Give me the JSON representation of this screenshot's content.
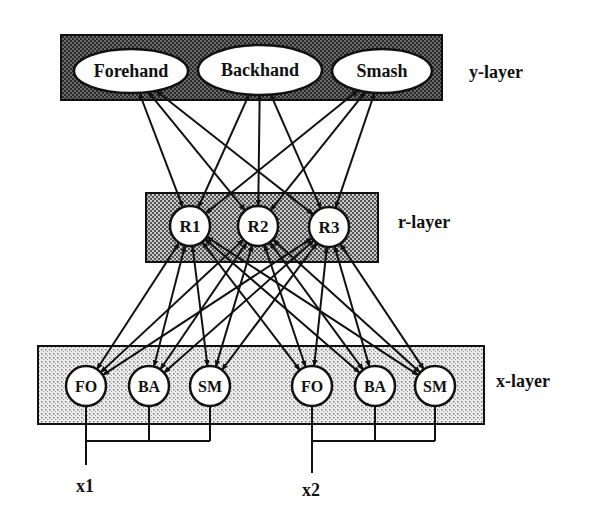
{
  "diagram": {
    "type": "layered-network",
    "layers": {
      "y": {
        "label": "y-layer",
        "nodes": [
          {
            "id": "forehand",
            "label": "Forehand",
            "cx": 131,
            "cy": 71,
            "rx": 57,
            "ry": 22
          },
          {
            "id": "backhand",
            "label": "Backhand",
            "cx": 260,
            "cy": 70,
            "rx": 62,
            "ry": 25
          },
          {
            "id": "smash",
            "label": "Smash",
            "cx": 382,
            "cy": 71,
            "rx": 50,
            "ry": 22
          }
        ]
      },
      "r": {
        "label": "r-layer",
        "nodes": [
          {
            "id": "r1",
            "label": "R1",
            "cx": 190,
            "cy": 226
          },
          {
            "id": "r2",
            "label": "R2",
            "cx": 258,
            "cy": 226
          },
          {
            "id": "r3",
            "label": "R3",
            "cx": 329,
            "cy": 227
          }
        ]
      },
      "x": {
        "label": "x-layer",
        "nodes": [
          {
            "id": "x1-fo",
            "label": "FO",
            "cx": 86,
            "cy": 386,
            "group": "x1"
          },
          {
            "id": "x1-ba",
            "label": "BA",
            "cx": 149,
            "cy": 386,
            "group": "x1"
          },
          {
            "id": "x1-sm",
            "label": "SM",
            "cx": 210,
            "cy": 386,
            "group": "x1"
          },
          {
            "id": "x2-fo",
            "label": "FO",
            "cx": 312,
            "cy": 386,
            "group": "x2"
          },
          {
            "id": "x2-ba",
            "label": "BA",
            "cx": 375,
            "cy": 386,
            "group": "x2"
          },
          {
            "id": "x2-sm",
            "label": "SM",
            "cx": 435,
            "cy": 386,
            "group": "x2"
          }
        ]
      }
    },
    "inputs": [
      {
        "id": "x1",
        "label": "x1"
      },
      {
        "id": "x2",
        "label": "x2"
      }
    ],
    "connections": "bidirectional arrows: every y-node to every r-node, every r-node to every x-node",
    "colors": {
      "ink": "#111111",
      "y_box_fill": "#3a3a3a",
      "r_box_fill": "#9a9a9a",
      "x_box_fill": "#d6d6d6",
      "node_fill": "#ffffff"
    }
  }
}
